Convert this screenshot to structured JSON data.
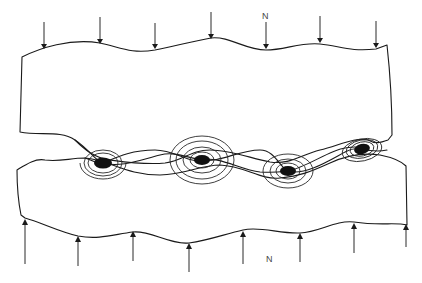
{
  "figure": {
    "type": "schematic",
    "labels": {
      "top_load": "N",
      "bottom_load": "N"
    },
    "colors": {
      "line": "#1a1a1a",
      "asperity_fill": "#111111",
      "background": "#ffffff",
      "label": "#444444"
    },
    "top_arrows_x": [
      44,
      100,
      155,
      211,
      266,
      320,
      376
    ],
    "bottom_arrows_x": [
      25,
      78,
      133,
      189,
      243,
      300,
      354,
      406
    ],
    "contacts": [
      {
        "x": 103,
        "y": 163,
        "rings": 3
      },
      {
        "x": 202,
        "y": 160,
        "rings": 4
      },
      {
        "x": 288,
        "y": 171,
        "rings": 3
      },
      {
        "x": 362,
        "y": 149,
        "rings": 3
      }
    ]
  }
}
